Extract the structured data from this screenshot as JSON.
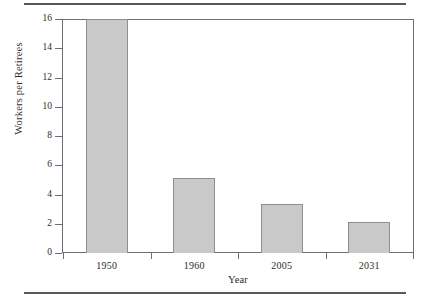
{
  "chart_data": {
    "type": "bar",
    "title": "",
    "subtitle": "",
    "xlabel": "Year",
    "ylabel": "Workers per Retirees",
    "categories": [
      "1950",
      "1960",
      "2005",
      "2031"
    ],
    "values": [
      16,
      5.1,
      3.35,
      2.15
    ],
    "series": [
      {
        "name": "Workers per Retirees",
        "values": [
          16,
          5.1,
          3.35,
          2.15
        ]
      }
    ],
    "ylim": [
      0,
      16
    ],
    "ytick_labels": [
      "16",
      "14",
      "12",
      "10",
      "8",
      "6",
      "4",
      "2",
      "0"
    ],
    "ytick_values": [
      16,
      14,
      12,
      10,
      8,
      6,
      4,
      2,
      0
    ],
    "ytick_step": 2,
    "xtick_labels": [
      "1950",
      "1960",
      "2005",
      "2031"
    ],
    "grid": false,
    "legend": false,
    "legend_position": "none",
    "annotations": [],
    "colors": {
      "bar_fill": "#c9c9c9",
      "bar_border": "#8e8e90",
      "axis": "#6e6e70",
      "text": "#2b2b2b",
      "page_rule": "#58585a",
      "background": "#ffffff"
    }
  },
  "figure": {
    "y_axis_title": "Workers per Retirees",
    "x_axis_title": "Year"
  }
}
